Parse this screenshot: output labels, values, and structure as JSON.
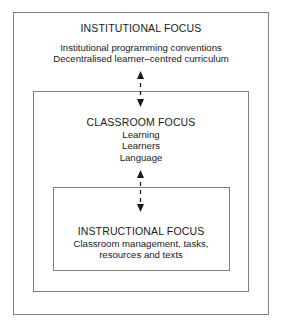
{
  "diagram": {
    "title_visible": false,
    "colors": {
      "background": "#ffffff",
      "border": "#808080",
      "text": "#1a1a1a",
      "arrow": "#1a1a1a"
    },
    "levels": [
      {
        "id": "institutional",
        "heading": "INSTITUTIONAL FOCUS",
        "lines": [
          "Institutional programming conventions",
          "Decentralised learner–centred curriculum"
        ]
      },
      {
        "id": "classroom",
        "heading": "CLASSROOM FOCUS",
        "lines": [
          "Learning",
          "Learners",
          "Language"
        ]
      },
      {
        "id": "instructional",
        "heading": "INSTRUCTIONAL FOCUS",
        "lines": [
          "Classroom management, tasks,",
          "resources and texts"
        ]
      }
    ],
    "connectors": [
      {
        "id": "institutional-to-classroom",
        "style": "double-headed-dashed-vertical-arrow",
        "from": "institutional",
        "to": "classroom"
      },
      {
        "id": "classroom-to-instructional",
        "style": "double-headed-dashed-vertical-arrow",
        "from": "classroom",
        "to": "instructional"
      }
    ]
  }
}
